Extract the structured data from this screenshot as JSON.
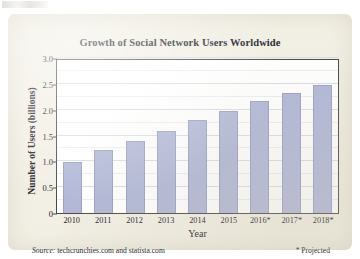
{
  "figure": {
    "background_color": "#f2efe4",
    "bar_color": "#b2b8d8",
    "bar_edge_color": "#9aa1c6"
  },
  "footer": {
    "source_lead": "Source:",
    "source_text": "techcrunchies.com and statista.com",
    "projected_note": "* Projected"
  },
  "chart_data": {
    "type": "bar",
    "title": "Growth of Social Network Users Worldwide",
    "xlabel": "Year",
    "ylabel": "Number of Users (billions)",
    "categories": [
      "2010",
      "2011",
      "2012",
      "2013",
      "2014",
      "2015",
      "2016*",
      "2017*",
      "2018*"
    ],
    "values": [
      0.99,
      1.22,
      1.4,
      1.59,
      1.8,
      1.98,
      2.16,
      2.32,
      2.48
    ],
    "ylim": [
      0,
      3.0
    ],
    "ytick_labels": [
      "0",
      "0.5",
      "1.0",
      "1.5",
      "2.0",
      "2.5",
      "3.0"
    ],
    "ytick_values": [
      0,
      0.5,
      1.0,
      1.5,
      2.0,
      2.5,
      3.0
    ],
    "grid": true,
    "legend": false
  }
}
